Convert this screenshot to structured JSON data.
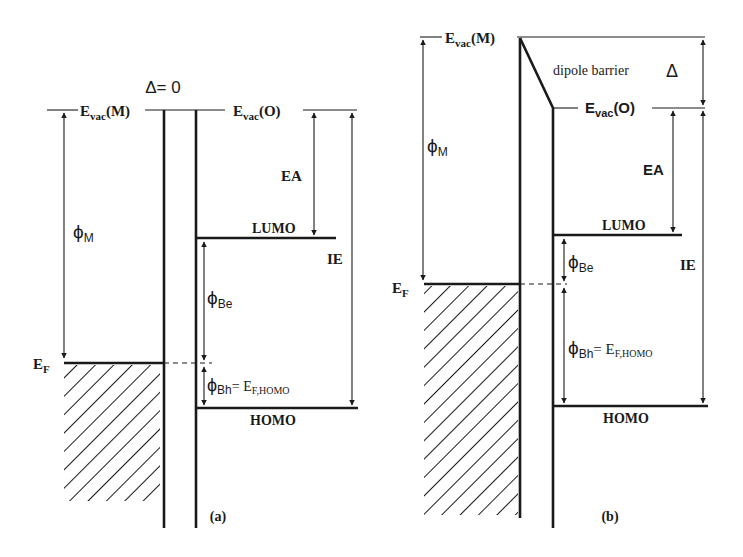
{
  "figure": {
    "panel_a": {
      "caption": "(a)",
      "delta_label": "Δ= 0",
      "evac_metal": {
        "main": "E",
        "sub": "vac",
        "suffix": "(M)"
      },
      "evac_organic": {
        "main": "E",
        "sub": "vac",
        "suffix": "(O)"
      },
      "ea_label": "EA",
      "ie_label": "IE",
      "lumo_label": "LUMO",
      "homo_label": "HOMO",
      "phi_m": {
        "main": "ϕ",
        "sub": "M"
      },
      "ef": {
        "main": "E",
        "sub": "F"
      },
      "phi_be": {
        "main": "ϕ",
        "sub": "Be"
      },
      "phi_bh": {
        "main": "ϕ",
        "sub": "Bh",
        "eq": "= E",
        "eq_sub": "F,HOMO"
      }
    },
    "panel_b": {
      "caption": "(b)",
      "dipole_label": "dipole barrier",
      "delta_symbol": "Δ",
      "evac_metal": {
        "main": "E",
        "sub": "vac",
        "suffix": "(M)"
      },
      "evac_organic": {
        "main": "E",
        "sub": "vac",
        "suffix": "(O)"
      },
      "ea_label": "EA",
      "ie_label": "IE",
      "lumo_label": "LUMO",
      "homo_label": "HOMO",
      "phi_m": {
        "main": "ϕ",
        "sub": "M"
      },
      "ef": {
        "main": "E",
        "sub": "F"
      },
      "phi_be": {
        "main": "ϕ",
        "sub": "Be"
      },
      "phi_bh": {
        "main": "ϕ",
        "sub": "Bh",
        "eq": "= E",
        "eq_sub": "F,HOMO"
      }
    }
  }
}
